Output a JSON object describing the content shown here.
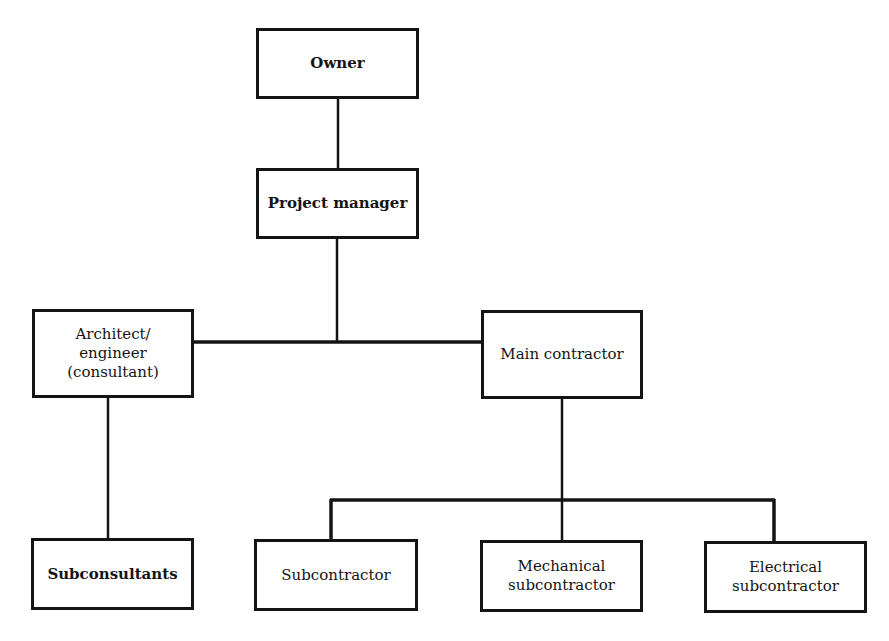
{
  "diagram": {
    "type": "organization-chart",
    "line_color": "#141414",
    "nodes": {
      "owner": {
        "label": "Owner"
      },
      "project_manager": {
        "label": "Project manager"
      },
      "architect": {
        "label": "Architect/\nengineer\n(consultant)"
      },
      "main_contractor": {
        "label": "Main contractor"
      },
      "subconsultants": {
        "label": "Subconsultants"
      },
      "subcontractor": {
        "label": "Subcontractor"
      },
      "mechanical": {
        "label": "Mechanical\nsubcontractor"
      },
      "electrical": {
        "label": "Electrical\nsubcontractor"
      }
    },
    "edges": [
      {
        "from": "Owner",
        "to": "Project manager"
      },
      {
        "from": "Project manager",
        "to": "Architect/engineer (consultant)"
      },
      {
        "from": "Project manager",
        "to": "Main contractor"
      },
      {
        "from": "Architect/engineer (consultant)",
        "to": "Subconsultants"
      },
      {
        "from": "Main contractor",
        "to": "Subcontractor"
      },
      {
        "from": "Main contractor",
        "to": "Mechanical subcontractor"
      },
      {
        "from": "Main contractor",
        "to": "Electrical subcontractor"
      }
    ]
  }
}
